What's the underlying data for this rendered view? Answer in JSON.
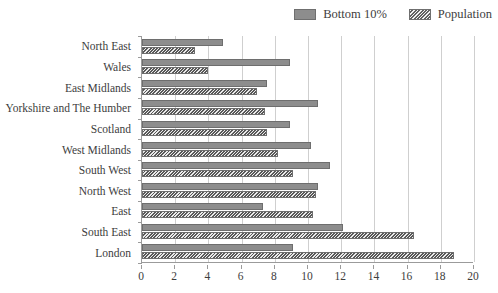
{
  "legend": {
    "position": "top-right",
    "entries": [
      {
        "label": "Bottom 10%",
        "swatch": "solid-gray-swatch",
        "color": "#8d8d8d"
      },
      {
        "label": "Population",
        "swatch": "hatched-gray-swatch",
        "color": "#9a9a9a"
      }
    ]
  },
  "chart_data": {
    "type": "bar",
    "orientation": "horizontal",
    "title": "",
    "xlabel": "",
    "ylabel": "",
    "xlim": [
      0,
      20
    ],
    "xticks": [
      0,
      2,
      4,
      6,
      8,
      10,
      12,
      14,
      16,
      18,
      20
    ],
    "grid": true,
    "legend_position": "top-right",
    "categories": [
      "North East",
      "Wales",
      "East Midlands",
      "Yorkshire and The Humber",
      "Scotland",
      "West Midlands",
      "South West",
      "North West",
      "East",
      "South East",
      "London"
    ],
    "series": [
      {
        "name": "Bottom 10%",
        "color": "#8d8d8d",
        "pattern": "solid",
        "values": [
          4.9,
          8.9,
          7.5,
          10.6,
          8.9,
          10.2,
          11.3,
          10.6,
          7.3,
          12.1,
          9.1
        ]
      },
      {
        "name": "Population",
        "color": "#9a9a9a",
        "pattern": "diagonal-hatch",
        "values": [
          3.2,
          4.0,
          6.9,
          7.4,
          7.5,
          8.2,
          9.1,
          10.5,
          10.3,
          16.4,
          18.8
        ]
      }
    ]
  },
  "colors": {
    "bottom10": "#8d8d8d",
    "population": "#9a9a9a",
    "grid": "#cfcfcf",
    "axis": "#9b9b9b",
    "text": "#3d3d3d",
    "background": "#ffffff"
  }
}
